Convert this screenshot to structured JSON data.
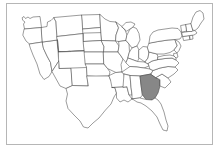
{
  "figure": {
    "type": "choropleth-locator-map",
    "background_color": "#ffffff",
    "frame_color": "#b6b6b6",
    "outline_color": "#4a4a4a",
    "highlight_color": "#878787",
    "highlighted_state": "Georgia",
    "highlighted_state_code": "GA",
    "caption": "",
    "title": ""
  },
  "legend": {
    "present": false,
    "items": []
  },
  "labels": {
    "state_labels_visible": false,
    "visible_text": []
  },
  "map_data": {
    "projection": "albers-usa-approx",
    "highlighted": [
      "GA"
    ],
    "states": [
      {
        "code": "WA",
        "name": "Washington",
        "highlighted": false
      },
      {
        "code": "OR",
        "name": "Oregon",
        "highlighted": false
      },
      {
        "code": "CA",
        "name": "California",
        "highlighted": false
      },
      {
        "code": "NV",
        "name": "Nevada",
        "highlighted": false
      },
      {
        "code": "ID",
        "name": "Idaho",
        "highlighted": false
      },
      {
        "code": "MT",
        "name": "Montana",
        "highlighted": false
      },
      {
        "code": "WY",
        "name": "Wyoming",
        "highlighted": false
      },
      {
        "code": "UT",
        "name": "Utah",
        "highlighted": false
      },
      {
        "code": "AZ",
        "name": "Arizona",
        "highlighted": false
      },
      {
        "code": "NM",
        "name": "New Mexico",
        "highlighted": false
      },
      {
        "code": "CO",
        "name": "Colorado",
        "highlighted": false
      },
      {
        "code": "ND",
        "name": "North Dakota",
        "highlighted": false
      },
      {
        "code": "SD",
        "name": "South Dakota",
        "highlighted": false
      },
      {
        "code": "NE",
        "name": "Nebraska",
        "highlighted": false
      },
      {
        "code": "KS",
        "name": "Kansas",
        "highlighted": false
      },
      {
        "code": "OK",
        "name": "Oklahoma",
        "highlighted": false
      },
      {
        "code": "TX",
        "name": "Texas",
        "highlighted": false
      },
      {
        "code": "MN",
        "name": "Minnesota",
        "highlighted": false
      },
      {
        "code": "IA",
        "name": "Iowa",
        "highlighted": false
      },
      {
        "code": "MO",
        "name": "Missouri",
        "highlighted": false
      },
      {
        "code": "AR",
        "name": "Arkansas",
        "highlighted": false
      },
      {
        "code": "LA",
        "name": "Louisiana",
        "highlighted": false
      },
      {
        "code": "WI",
        "name": "Wisconsin",
        "highlighted": false
      },
      {
        "code": "IL",
        "name": "Illinois",
        "highlighted": false
      },
      {
        "code": "MI",
        "name": "Michigan",
        "highlighted": false
      },
      {
        "code": "IN",
        "name": "Indiana",
        "highlighted": false
      },
      {
        "code": "OH",
        "name": "Ohio",
        "highlighted": false
      },
      {
        "code": "KY",
        "name": "Kentucky",
        "highlighted": false
      },
      {
        "code": "TN",
        "name": "Tennessee",
        "highlighted": false
      },
      {
        "code": "MS",
        "name": "Mississippi",
        "highlighted": false
      },
      {
        "code": "AL",
        "name": "Alabama",
        "highlighted": false
      },
      {
        "code": "GA",
        "name": "Georgia",
        "highlighted": true
      },
      {
        "code": "FL",
        "name": "Florida",
        "highlighted": false
      },
      {
        "code": "SC",
        "name": "South Carolina",
        "highlighted": false
      },
      {
        "code": "NC",
        "name": "North Carolina",
        "highlighted": false
      },
      {
        "code": "VA",
        "name": "Virginia",
        "highlighted": false
      },
      {
        "code": "WV",
        "name": "West Virginia",
        "highlighted": false
      },
      {
        "code": "MD",
        "name": "Maryland",
        "highlighted": false
      },
      {
        "code": "DE",
        "name": "Delaware",
        "highlighted": false
      },
      {
        "code": "PA",
        "name": "Pennsylvania",
        "highlighted": false
      },
      {
        "code": "NJ",
        "name": "New Jersey",
        "highlighted": false
      },
      {
        "code": "NY",
        "name": "New York",
        "highlighted": false
      },
      {
        "code": "CT",
        "name": "Connecticut",
        "highlighted": false
      },
      {
        "code": "RI",
        "name": "Rhode Island",
        "highlighted": false
      },
      {
        "code": "MA",
        "name": "Massachusetts",
        "highlighted": false
      },
      {
        "code": "VT",
        "name": "Vermont",
        "highlighted": false
      },
      {
        "code": "NH",
        "name": "New Hampshire",
        "highlighted": false
      },
      {
        "code": "ME",
        "name": "Maine",
        "highlighted": false
      }
    ]
  }
}
